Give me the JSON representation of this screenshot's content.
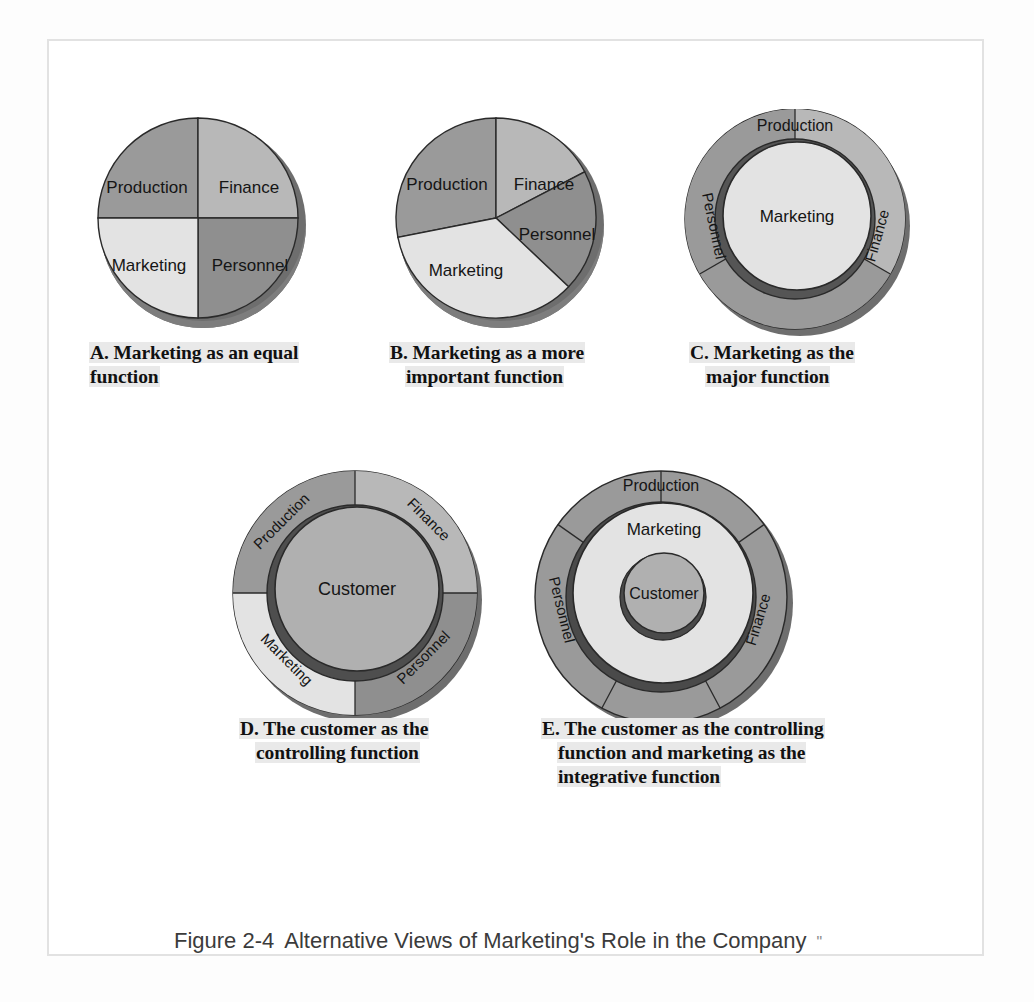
{
  "figure": {
    "number": "Figure 2-4",
    "title": "Alternative Views of Marketing's Role in the Company",
    "marks": "\"",
    "full_caption": "Figure 2-4  Alternative Views of Marketing's Role in the Company"
  },
  "colors": {
    "production": "#9a9a9a",
    "finance": "#b8b8b8",
    "marketing": "#e3e3e3",
    "personnel": "#8f8f8f",
    "customer": "#b0b0b0",
    "shadow_dark": "#6e6e6e",
    "shadow_mid": "#848484",
    "outline": "#2a2a2a",
    "frame": "#e2e2e2",
    "highlight": "#e9e9e9",
    "text": "#111111"
  },
  "labels": {
    "production": "Production",
    "finance": "Finance",
    "marketing": "Marketing",
    "personnel": "Personnel",
    "customer": "Customer"
  },
  "diagrams": [
    {
      "id": "A",
      "letter": "A.",
      "type": "pie",
      "caption_line1": "Marketing as an equal",
      "caption_line2": "function",
      "caption_full": "A. Marketing as an equal function",
      "segments": [
        {
          "label": "Production",
          "percent": 25,
          "start_deg": 270,
          "end_deg": 360,
          "fill": "#9a9a9a"
        },
        {
          "label": "Finance",
          "percent": 25,
          "start_deg": 0,
          "end_deg": 90,
          "fill": "#b8b8b8"
        },
        {
          "label": "Personnel",
          "percent": 25,
          "start_deg": 90,
          "end_deg": 180,
          "fill": "#8f8f8f"
        },
        {
          "label": "Marketing",
          "percent": 25,
          "start_deg": 180,
          "end_deg": 270,
          "fill": "#e3e3e3"
        }
      ]
    },
    {
      "id": "B",
      "letter": "B.",
      "type": "pie",
      "caption_line1": "Marketing as a more",
      "caption_line2": "important function",
      "caption_full": "B. Marketing as a more important function",
      "segments": [
        {
          "label": "Production",
          "percent": 22,
          "start_deg": 281,
          "end_deg": 360,
          "fill": "#9a9a9a"
        },
        {
          "label": "Finance",
          "percent": 15,
          "start_deg": 0,
          "end_deg": 54,
          "fill": "#b8b8b8"
        },
        {
          "label": "Personnel",
          "percent": 23,
          "start_deg": 54,
          "end_deg": 137,
          "fill": "#8f8f8f"
        },
        {
          "label": "Marketing",
          "percent": 40,
          "start_deg": 137,
          "end_deg": 281,
          "fill": "#e3e3e3"
        }
      ]
    },
    {
      "id": "C",
      "letter": "C.",
      "type": "ring",
      "caption_line1": "Marketing as the",
      "caption_line2": "major function",
      "caption_full": "C. Marketing as the major function",
      "center_label": "Marketing",
      "ring_segments": [
        {
          "label": "Production",
          "start_deg": 240,
          "end_deg": 300,
          "fill": "#9a9a9a"
        },
        {
          "label": "Finance",
          "start_deg": 300,
          "end_deg": 60,
          "fill": "#b8b8b8"
        },
        {
          "label": "Personnel",
          "start_deg": 60,
          "end_deg": 240,
          "fill": "#9a9a9a"
        }
      ]
    },
    {
      "id": "D",
      "letter": "D.",
      "type": "ring",
      "caption_line1": "The customer as the",
      "caption_line2": "controlling function",
      "caption_full": "D. The customer as the controlling function",
      "center_label": "Customer",
      "ring_segments": [
        {
          "label": "Production",
          "start_deg": 180,
          "end_deg": 270,
          "fill": "#9a9a9a"
        },
        {
          "label": "Finance",
          "start_deg": 270,
          "end_deg": 0,
          "fill": "#b8b8b8"
        },
        {
          "label": "Personnel",
          "start_deg": 0,
          "end_deg": 90,
          "fill": "#8f8f8f"
        },
        {
          "label": "Marketing",
          "start_deg": 90,
          "end_deg": 180,
          "fill": "#e3e3e3"
        }
      ]
    },
    {
      "id": "E",
      "letter": "E.",
      "type": "nested-ring",
      "caption_line1": "The customer as the controlling",
      "caption_line2": "function and marketing as the",
      "caption_line3": "integrative function",
      "caption_full": "E. The customer as the controlling function and marketing as the integrative function",
      "middle_label": "Marketing",
      "center_label": "Customer",
      "ring_segments": [
        {
          "label": "Production",
          "start_deg": 242,
          "end_deg": 300,
          "fill": "#9a9a9a"
        },
        {
          "label": "Finance",
          "start_deg": 300,
          "end_deg": 62,
          "fill": "#9a9a9a"
        },
        {
          "label": "Personnel",
          "start_deg": 62,
          "end_deg": 242,
          "fill": "#9a9a9a"
        }
      ]
    }
  ]
}
